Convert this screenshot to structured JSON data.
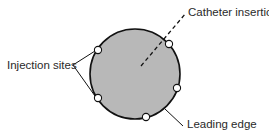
{
  "diagram": {
    "labels": {
      "catheter_insertion": "Catheter insertion",
      "injection_sites": "Injection sites",
      "leading_edge": "Leading edge"
    },
    "colors": {
      "fill": "#b8b8b8",
      "stroke": "#111111",
      "marker_fill": "#ffffff",
      "text": "#2a2a2a"
    },
    "main_circle": {
      "cx": 135,
      "cy": 74,
      "r": 45
    },
    "markers": [
      {
        "cx": 98,
        "cy": 50
      },
      {
        "cx": 169,
        "cy": 44
      },
      {
        "cx": 98,
        "cy": 98
      },
      {
        "cx": 177,
        "cy": 88
      },
      {
        "cx": 146,
        "cy": 117
      }
    ]
  }
}
